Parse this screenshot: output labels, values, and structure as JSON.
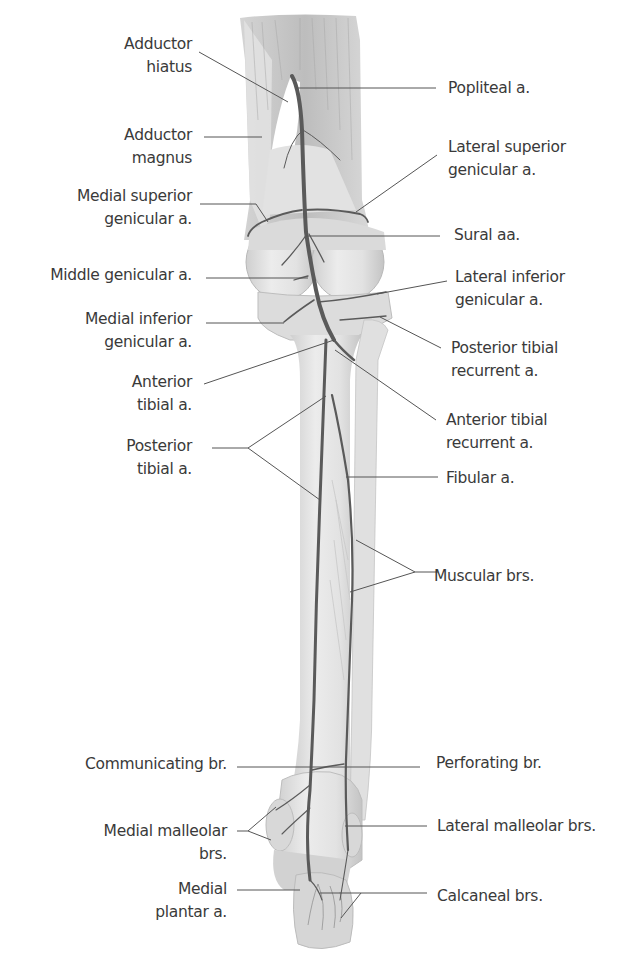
{
  "figure": {
    "colors": {
      "background": "#ffffff",
      "label_text": "#3a3a3a",
      "leader_line": "#555555",
      "artery": "#5a5a5a",
      "bone_fill": "#e6e6e6",
      "bone_shade": "#c8c8c8",
      "muscle_fill": "#d9d9d9"
    },
    "labels_left": [
      {
        "id": "adductor-hiatus",
        "lines": [
          "Adductor",
          "hiatus"
        ]
      },
      {
        "id": "adductor-magnus",
        "lines": [
          "Adductor",
          "magnus"
        ]
      },
      {
        "id": "medial-superior-genicular",
        "lines": [
          "Medial superior",
          "genicular a."
        ]
      },
      {
        "id": "middle-genicular",
        "lines": [
          "Middle genicular a."
        ]
      },
      {
        "id": "medial-inferior-genicular",
        "lines": [
          "Medial inferior",
          "genicular a."
        ]
      },
      {
        "id": "anterior-tibial",
        "lines": [
          "Anterior",
          "tibial a."
        ]
      },
      {
        "id": "posterior-tibial",
        "lines": [
          "Posterior",
          "tibial a."
        ]
      },
      {
        "id": "communicating-br",
        "lines": [
          "Communicating br."
        ]
      },
      {
        "id": "medial-malleolar-brs",
        "lines": [
          "Medial malleolar",
          "brs."
        ]
      },
      {
        "id": "medial-plantar",
        "lines": [
          "Medial",
          "plantar a."
        ]
      }
    ],
    "labels_right": [
      {
        "id": "popliteal",
        "lines": [
          "Popliteal a."
        ]
      },
      {
        "id": "lateral-superior-genicular",
        "lines": [
          "Lateral superior",
          "genicular a."
        ]
      },
      {
        "id": "sural",
        "lines": [
          "Sural aa."
        ]
      },
      {
        "id": "lateral-inferior-genicular",
        "lines": [
          "Lateral inferior",
          "genicular a."
        ]
      },
      {
        "id": "posterior-tibial-recurrent",
        "lines": [
          "Posterior tibial",
          "recurrent a."
        ]
      },
      {
        "id": "anterior-tibial-recurrent",
        "lines": [
          "Anterior tibial",
          "recurrent a."
        ]
      },
      {
        "id": "fibular",
        "lines": [
          "Fibular a."
        ]
      },
      {
        "id": "muscular-brs",
        "lines": [
          "Muscular brs."
        ]
      },
      {
        "id": "perforating-br",
        "lines": [
          "Perforating br."
        ]
      },
      {
        "id": "lateral-malleolar-brs",
        "lines": [
          "Lateral malleolar brs."
        ]
      },
      {
        "id": "calcaneal-brs",
        "lines": [
          "Calcaneal brs."
        ]
      }
    ]
  }
}
